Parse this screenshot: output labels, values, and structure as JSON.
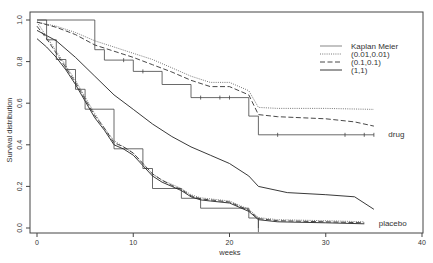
{
  "chart_data": {
    "type": "line",
    "title": "",
    "xlabel": "weeks",
    "ylabel": "Survival distribution",
    "xlim": [
      0,
      40
    ],
    "ylim": [
      0,
      1.0
    ],
    "xticks": [
      "0",
      "10",
      "20",
      "30",
      "40"
    ],
    "yticks": [
      "0.0",
      "0.2",
      "0.4",
      "0.6",
      "0.8",
      "1.0"
    ],
    "grid": false,
    "legend_position": "upper right",
    "legend": [
      {
        "label": "Kaplan Meier",
        "style": "solid-thin"
      },
      {
        "label": "(0.01,0.01)",
        "style": "dotted"
      },
      {
        "label": "(0.1,0.1)",
        "style": "dashed"
      },
      {
        "label": "(1,1)",
        "style": "solid"
      }
    ],
    "annotations": [
      {
        "text": "drug",
        "x": 36.5,
        "y": 0.45
      },
      {
        "text": "placebo",
        "x": 35.5,
        "y": 0.025
      }
    ],
    "series": [
      {
        "name": "Kaplan Meier (drug)",
        "group": "drug",
        "style": "step",
        "x": [
          0,
          6,
          6,
          7,
          7,
          10,
          10,
          13,
          13,
          16,
          16,
          22,
          22,
          23,
          23,
          35
        ],
        "y": [
          1.0,
          1.0,
          0.857,
          0.857,
          0.807,
          0.807,
          0.753,
          0.753,
          0.69,
          0.69,
          0.627,
          0.627,
          0.538,
          0.538,
          0.448,
          0.448
        ],
        "censor_marks_x": [
          9,
          11,
          17,
          19,
          20,
          25,
          32,
          34,
          35
        ]
      },
      {
        "name": "(0.01,0.01) drug",
        "group": "drug",
        "style": "dotted",
        "x": [
          0,
          2,
          4,
          6,
          8,
          10,
          12,
          14,
          16,
          18,
          20,
          22,
          23,
          25,
          30,
          35
        ],
        "y": [
          0.99,
          0.97,
          0.94,
          0.9,
          0.87,
          0.84,
          0.81,
          0.77,
          0.73,
          0.7,
          0.7,
          0.66,
          0.58,
          0.575,
          0.575,
          0.57
        ]
      },
      {
        "name": "(0.1,0.1) drug",
        "group": "drug",
        "style": "dashed",
        "x": [
          0,
          2,
          4,
          6,
          8,
          10,
          12,
          14,
          16,
          18,
          20,
          22,
          23,
          25,
          30,
          33,
          35
        ],
        "y": [
          0.99,
          0.965,
          0.93,
          0.88,
          0.85,
          0.82,
          0.785,
          0.75,
          0.71,
          0.68,
          0.68,
          0.64,
          0.545,
          0.535,
          0.525,
          0.51,
          0.49
        ]
      },
      {
        "name": "(1,1) drug",
        "group": "drug",
        "style": "solid",
        "x": [
          0,
          2,
          4,
          6,
          8,
          10,
          12,
          14,
          16,
          18,
          20,
          22,
          23,
          26,
          30,
          33,
          35
        ],
        "y": [
          0.95,
          0.9,
          0.82,
          0.73,
          0.64,
          0.57,
          0.5,
          0.44,
          0.39,
          0.35,
          0.31,
          0.25,
          0.2,
          0.17,
          0.16,
          0.15,
          0.09
        ]
      },
      {
        "name": "Kaplan Meier (placebo)",
        "group": "placebo",
        "style": "step",
        "x": [
          0,
          1,
          1,
          2,
          2,
          3,
          3,
          4,
          4,
          5,
          5,
          8,
          8,
          11,
          11,
          12,
          12,
          15,
          15,
          17,
          17,
          22,
          22,
          23,
          23
        ],
        "y": [
          1.0,
          1.0,
          0.905,
          0.905,
          0.81,
          0.81,
          0.762,
          0.762,
          0.667,
          0.667,
          0.571,
          0.571,
          0.381,
          0.381,
          0.286,
          0.286,
          0.19,
          0.19,
          0.143,
          0.143,
          0.095,
          0.095,
          0.048,
          0.048,
          0.0
        ]
      },
      {
        "name": "(0.01,0.01) placebo",
        "group": "placebo",
        "style": "dotted",
        "x": [
          0,
          1,
          2,
          3,
          4,
          5,
          6,
          7,
          8,
          9,
          10,
          11,
          12,
          13,
          14,
          15,
          16,
          17,
          18,
          20,
          22,
          23,
          25,
          30,
          34
        ],
        "y": [
          0.99,
          0.92,
          0.85,
          0.78,
          0.71,
          0.63,
          0.55,
          0.48,
          0.42,
          0.39,
          0.36,
          0.31,
          0.26,
          0.23,
          0.21,
          0.19,
          0.16,
          0.145,
          0.14,
          0.13,
          0.09,
          0.05,
          0.04,
          0.035,
          0.03
        ]
      },
      {
        "name": "(0.1,0.1) placebo",
        "group": "placebo",
        "style": "dashed",
        "x": [
          0,
          1,
          2,
          3,
          4,
          5,
          6,
          7,
          8,
          9,
          10,
          11,
          12,
          13,
          14,
          15,
          16,
          17,
          18,
          20,
          22,
          23,
          25,
          30,
          34
        ],
        "y": [
          0.97,
          0.91,
          0.84,
          0.77,
          0.7,
          0.62,
          0.54,
          0.48,
          0.41,
          0.39,
          0.36,
          0.31,
          0.26,
          0.23,
          0.205,
          0.185,
          0.155,
          0.14,
          0.135,
          0.125,
          0.085,
          0.045,
          0.035,
          0.03,
          0.025
        ]
      },
      {
        "name": "(1,1) placebo",
        "group": "placebo",
        "style": "solid",
        "x": [
          0,
          1,
          2,
          3,
          4,
          5,
          6,
          7,
          8,
          9,
          10,
          11,
          12,
          13,
          14,
          15,
          16,
          17,
          18,
          20,
          22,
          23,
          25,
          30,
          34
        ],
        "y": [
          0.91,
          0.87,
          0.82,
          0.76,
          0.69,
          0.61,
          0.53,
          0.47,
          0.4,
          0.38,
          0.35,
          0.3,
          0.25,
          0.22,
          0.2,
          0.18,
          0.15,
          0.135,
          0.13,
          0.12,
          0.08,
          0.04,
          0.03,
          0.025,
          0.02
        ]
      }
    ]
  }
}
